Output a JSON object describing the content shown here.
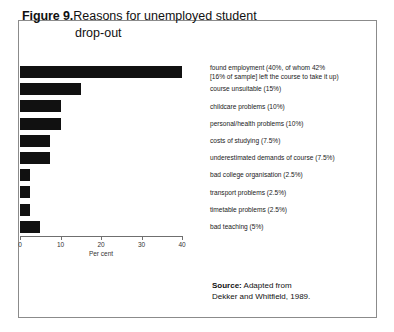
{
  "figure": {
    "label": "Figure 9.",
    "title_line1": "Reasons for unemployed student",
    "title_line2": "drop-out"
  },
  "source": {
    "label": "Source:",
    "text": "Adapted from",
    "text_line2": "Dekker and Whitfield, 1989."
  },
  "chart_data": {
    "type": "bar",
    "orientation": "horizontal",
    "title": "Reasons for unemployed student drop-out",
    "xlabel": "Per cent",
    "ylabel": "",
    "xlim": [
      0,
      40
    ],
    "xticks": [
      0,
      10,
      20,
      30,
      40
    ],
    "xtick_labels": [
      "0",
      "10",
      "20",
      "30",
      "40"
    ],
    "grid": false,
    "legend": false,
    "bar_color": "#111111",
    "categories": [
      "found employment (40%, of whom 42%\n[16% of sample] left the course to take it up)",
      "course unsuitable (15%)",
      "childcare problems (10%)",
      "personal/health problems (10%)",
      "costs of studying (7.5%)",
      "underestimated demands of course (7.5%)",
      "bad college organisation (2.5%)",
      "transport problems (2.5%)",
      "timetable problems (2.5%)",
      "bad teaching (5%)"
    ],
    "values": [
      40,
      15,
      10,
      10,
      7.5,
      7.5,
      2.5,
      2.5,
      2.5,
      5
    ]
  }
}
